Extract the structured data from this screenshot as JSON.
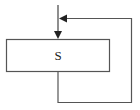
{
  "diagram": {
    "type": "flowchart-loop",
    "process_box": {
      "label": "S"
    },
    "colors": {
      "line": "#555555",
      "box_border": "#555555",
      "arrow": "#222222",
      "background": "#ffffff"
    }
  }
}
